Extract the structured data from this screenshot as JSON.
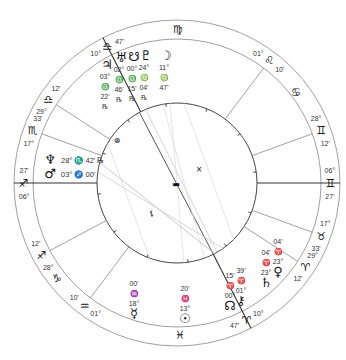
{
  "chart": {
    "type": "natal-wheel",
    "center": [
      177,
      183
    ],
    "radii": {
      "outer": 163,
      "zodiac_inner": 144,
      "inner": 80
    },
    "colors": {
      "line": "#555555",
      "faint": "#bbbbbb",
      "text": "#333333",
      "glyph": "#111111"
    }
  },
  "house_cusps": [
    {
      "name": "asc-cusp",
      "angle": 180,
      "deg": "06°",
      "sign": "♐",
      "min": "27'",
      "bold": true
    },
    {
      "name": "cusp-2",
      "angle": 208,
      "deg": "28°",
      "sign": "♐",
      "min": "12'"
    },
    {
      "name": "cusp-3",
      "angle": 233,
      "deg": "01°",
      "sign": "♒",
      "min": "10'"
    },
    {
      "name": "cusp-4",
      "angle": 297,
      "deg": "10°",
      "sign": "♈",
      "min": "47'",
      "bold": true
    },
    {
      "name": "cusp-5",
      "angle": 327,
      "deg": "29°",
      "sign": "♈",
      "min": "12'"
    },
    {
      "name": "cusp-6",
      "angle": 340,
      "deg": "17°",
      "sign": "♉",
      "min": "33'"
    },
    {
      "name": "dsc-cusp",
      "angle": 0,
      "deg": "06°",
      "sign": "♊",
      "min": "27'",
      "bold": true
    },
    {
      "name": "cusp-8",
      "angle": 20,
      "deg": "28°",
      "sign": "♊",
      "min": "12'"
    },
    {
      "name": "cusp-9",
      "angle": 53,
      "deg": "01°",
      "sign": "♌",
      "min": "10'"
    },
    {
      "name": "mc-cusp",
      "angle": 117,
      "deg": "10°",
      "sign": "♎",
      "min": "47'",
      "bold": true
    },
    {
      "name": "cusp-11",
      "angle": 147,
      "deg": "29°",
      "sign": "♎",
      "min": "12'"
    },
    {
      "name": "cusp-12",
      "angle": 160,
      "deg": "17°",
      "sign": "♏",
      "min": "33'"
    }
  ],
  "zodiac_signs": [
    {
      "name": "virgo",
      "glyph": "♍",
      "x": 178,
      "y": 33
    },
    {
      "name": "cancer",
      "glyph": "♋",
      "x": 296,
      "y": 96
    },
    {
      "name": "capricorn",
      "glyph": "♑",
      "x": 57,
      "y": 282
    },
    {
      "name": "pisces",
      "glyph": "♓",
      "x": 180,
      "y": 339
    }
  ],
  "planets": [
    {
      "name": "moon",
      "glyph": "☽",
      "x": 166,
      "y": 60,
      "deg": "11°",
      "sign": "♍",
      "min": "47'",
      "retro": ""
    },
    {
      "name": "pluto",
      "glyph": "♇",
      "x": 146,
      "y": 60,
      "deg": "24°",
      "sign": "♍",
      "min": "04'",
      "retro": "℞"
    },
    {
      "name": "south-node",
      "glyph": "☋",
      "x": 134,
      "y": 61,
      "deg": "00°",
      "sign": "♎",
      "min": "15'",
      "retro": "℞"
    },
    {
      "name": "uranus",
      "glyph": "♅",
      "x": 121,
      "y": 62,
      "deg": "02°",
      "sign": "♎",
      "min": "46'",
      "retro": "℞"
    },
    {
      "name": "jupiter",
      "glyph": "♃",
      "x": 107,
      "y": 69,
      "deg": "03°",
      "sign": "♎",
      "min": "22'",
      "retro": "℞"
    },
    {
      "name": "neptune",
      "glyph": "♆",
      "x": 50,
      "y": 164,
      "label": "28° ♏ 42' ℞"
    },
    {
      "name": "mars",
      "glyph": "♂",
      "x": 50,
      "y": 178,
      "label": "03° ♐ 00'"
    },
    {
      "name": "mercury",
      "glyph": "☿",
      "x": 134,
      "y": 318,
      "deg": "18°",
      "sign": "♒",
      "min": "00'"
    },
    {
      "name": "sun",
      "glyph": "☉",
      "x": 185,
      "y": 323,
      "deg": "13°",
      "sign": "♓",
      "min": "20'"
    },
    {
      "name": "north-node",
      "glyph": "☊",
      "x": 230,
      "y": 310,
      "deg": "00°",
      "sign": "♈",
      "min": "15'",
      "retro": "℞"
    },
    {
      "name": "chiron",
      "glyph": "⚷",
      "x": 241,
      "y": 305,
      "deg": "01°",
      "sign": "♈",
      "min": "39'"
    },
    {
      "name": "saturn",
      "glyph": "♄",
      "x": 266,
      "y": 287,
      "deg": "23°",
      "sign": "♈",
      "min": "04'"
    },
    {
      "name": "venus",
      "glyph": "♀",
      "x": 278,
      "y": 276,
      "deg": "23°",
      "sign": "♈",
      "min": "04'"
    }
  ],
  "inner_glyphs": [
    {
      "name": "fortuna-marker",
      "glyph": "⊗",
      "x": 117,
      "y": 143
    },
    {
      "name": "vertex-marker",
      "glyph": "×",
      "x": 199,
      "y": 172
    },
    {
      "name": "aspect-hub",
      "glyph": "▬",
      "x": 176,
      "y": 187
    },
    {
      "name": "lilith-marker",
      "glyph": "⚸",
      "x": 152,
      "y": 216
    }
  ]
}
